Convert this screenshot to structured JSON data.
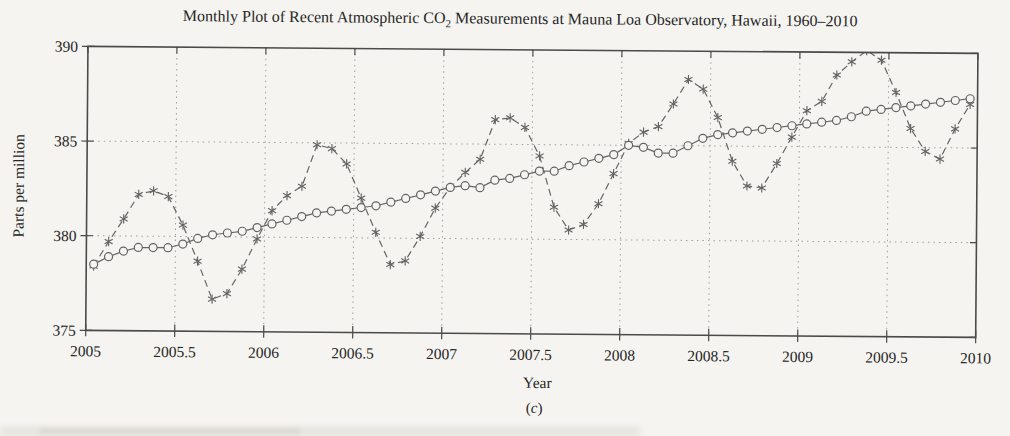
{
  "figure": {
    "title_prefix": "Monthly Plot of Recent Atmospheric CO",
    "title_sub": "2",
    "title_suffix": " Measurements at Mauna Loa Observatory, Hawaii, 1960–2010",
    "caption": "(c)"
  },
  "chart_data": {
    "type": "line",
    "xlabel": "Year",
    "ylabel": "Parts per million",
    "caption": "(c)",
    "xlim": [
      2005,
      2010
    ],
    "ylim": [
      375,
      390
    ],
    "x_ticks": [
      2005,
      2005.5,
      2006,
      2006.5,
      2007,
      2007.5,
      2008,
      2008.5,
      2009,
      2009.5,
      2010
    ],
    "x_tick_labels": [
      "2005",
      "2005.5",
      "2006",
      "2006.5",
      "2007",
      "2007.5",
      "2008",
      "2008.5",
      "2009",
      "2009.5",
      "2010"
    ],
    "y_ticks": [
      375,
      380,
      385,
      390
    ],
    "y_tick_labels": [
      "375",
      "380",
      "385",
      "390"
    ],
    "grid": {
      "style": "dotted",
      "vertical_at": [
        2005.5,
        2006,
        2006.5,
        2007,
        2007.5,
        2008,
        2008.5,
        2009,
        2009.5
      ],
      "horizontal_at": [
        380,
        385
      ]
    },
    "legend": "none",
    "sampling": {
      "note": "monthly data Jan 2005 - Dec 2009; x = year + (month - 0.5)/12",
      "x_start": 2005.0417,
      "x_step": 0.083333,
      "points": 60
    },
    "series": [
      {
        "name": "monthly CO2 measurements",
        "marker": "asterisk",
        "line_style": "dashed",
        "values": [
          378.4,
          379.7,
          380.9,
          382.2,
          382.4,
          382.1,
          380.6,
          378.7,
          376.7,
          377.0,
          378.3,
          379.9,
          381.4,
          382.2,
          382.7,
          384.9,
          384.7,
          383.9,
          382.1,
          380.3,
          378.6,
          378.8,
          380.1,
          381.6,
          382.7,
          383.5,
          384.2,
          386.3,
          386.4,
          385.9,
          384.4,
          381.7,
          380.5,
          380.8,
          381.9,
          383.5,
          385.1,
          385.7,
          386.0,
          387.2,
          388.5,
          388.0,
          386.5,
          384.2,
          382.9,
          382.8,
          384.1,
          385.5,
          386.9,
          387.4,
          388.8,
          389.5,
          390.1,
          389.6,
          387.9,
          386.0,
          384.8,
          384.4,
          386.0,
          387.3
        ]
      },
      {
        "name": "seasonally adjusted trend",
        "marker": "circle",
        "line_style": "solid",
        "values": [
          378.5,
          378.9,
          379.2,
          379.4,
          379.4,
          379.4,
          379.6,
          379.9,
          380.1,
          380.2,
          380.3,
          380.5,
          380.7,
          380.9,
          381.1,
          381.3,
          381.4,
          381.5,
          381.6,
          381.7,
          381.9,
          382.1,
          382.3,
          382.5,
          382.7,
          382.8,
          382.7,
          383.1,
          383.2,
          383.4,
          383.6,
          383.6,
          383.9,
          384.1,
          384.3,
          384.5,
          385.0,
          384.9,
          384.6,
          384.6,
          385.0,
          385.4,
          385.6,
          385.7,
          385.8,
          385.9,
          386.0,
          386.1,
          386.2,
          386.3,
          386.4,
          386.6,
          386.9,
          387.0,
          387.1,
          387.2,
          387.3,
          387.4,
          387.5,
          387.6
        ]
      }
    ],
    "colors": {
      "series": "#646464",
      "grid": "#9e9e9e",
      "frame": "#4a4a4a",
      "text": "#262626",
      "background": "#f5f4f0"
    }
  }
}
